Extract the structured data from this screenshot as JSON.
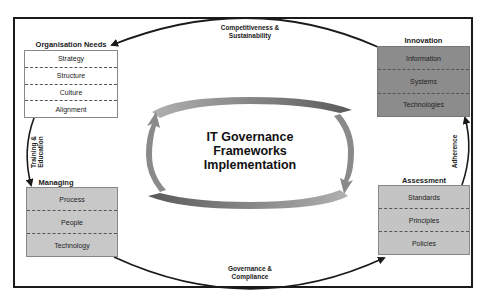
{
  "diagram": {
    "center_title": {
      "line1": "IT Governance",
      "line2": "Frameworks",
      "line3": "Implementation"
    },
    "boxes": [
      {
        "id": "organisation-needs",
        "title": "Organisation Needs",
        "items": [
          "Strategy",
          "Structure",
          "Culture",
          "Alignment"
        ],
        "fill": "#ffffff"
      },
      {
        "id": "innovation",
        "title": "Innovation",
        "items": [
          "Information",
          "Systems",
          "Technologies"
        ],
        "fill": "#8c8c8c"
      },
      {
        "id": "managing",
        "title": "Managing",
        "items": [
          "Process",
          "People",
          "Technology"
        ],
        "fill": "#c8c8c8"
      },
      {
        "id": "assessment",
        "title": "Assessment",
        "items": [
          "Standards",
          "Principles",
          "Policies"
        ],
        "fill": "#c4c4c4"
      }
    ],
    "edges": {
      "top": {
        "line1": "Competitiveness &",
        "line2": "Sustainability"
      },
      "bottom": {
        "line1": "Governance &",
        "line2": "Compliance"
      },
      "left": {
        "line1": "Training &",
        "line2": "Education"
      },
      "right": {
        "line1": "Adherence"
      }
    },
    "colors": {
      "frame": "#1a1a1a",
      "cycle_arrow": "#7a7a7a",
      "dashed_divider": "#555555"
    }
  }
}
